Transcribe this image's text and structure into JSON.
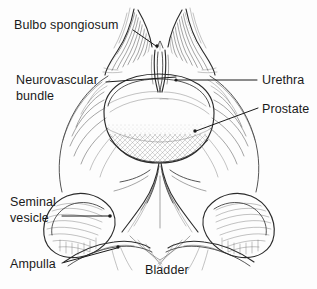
{
  "figure": {
    "style": "pen-and-ink line drawing",
    "background_color": "#fdfdfd",
    "ink_color": "#2b2b2b",
    "width": 317,
    "height": 289
  },
  "labels": [
    {
      "id": "bulbo-spongiosum",
      "text": "Bulbo spongiosum",
      "lines": [
        "Bulbo spongiosum"
      ],
      "text_x": 14,
      "text_y": 29,
      "anchor": "start",
      "leader": {
        "type": "line",
        "x1": 133,
        "y1": 30,
        "x2": 156,
        "y2": 46
      },
      "dot": {
        "x": 157,
        "y": 46
      }
    },
    {
      "id": "neurovascular-bundle",
      "text": "Neurovascular bundle",
      "lines": [
        "Neurovascular",
        "bundle"
      ],
      "text_x": 16,
      "text_y": 84,
      "anchor": "start",
      "leader": {
        "type": "line",
        "x1": 106,
        "y1": 82,
        "x2": 176,
        "y2": 77
      },
      "dot": null
    },
    {
      "id": "urethra",
      "text": "Urethra",
      "lines": [
        "Urethra"
      ],
      "text_x": 262,
      "text_y": 84,
      "anchor": "start",
      "leader": {
        "type": "line",
        "x1": 257,
        "y1": 80,
        "x2": 176,
        "y2": 80
      },
      "dot": {
        "x": 176,
        "y": 80
      }
    },
    {
      "id": "prostate",
      "text": "Prostate",
      "lines": [
        "Prostate"
      ],
      "text_x": 262,
      "text_y": 113,
      "anchor": "start",
      "leader": {
        "type": "line",
        "x1": 258,
        "y1": 108,
        "x2": 196,
        "y2": 131
      },
      "dot": {
        "x": 195,
        "y": 131
      }
    },
    {
      "id": "seminal-vesicle",
      "text": "Seminal vesicle",
      "lines": [
        "Seminal",
        "vesicle"
      ],
      "text_x": 10,
      "text_y": 206,
      "anchor": "start",
      "leader": {
        "type": "line",
        "x1": 62,
        "y1": 216,
        "x2": 109,
        "y2": 216
      },
      "dot": {
        "x": 110,
        "y": 216
      }
    },
    {
      "id": "ampulla",
      "text": "Ampulla",
      "lines": [
        "Ampulla"
      ],
      "text_x": 10,
      "text_y": 268,
      "anchor": "start",
      "leader": {
        "type": "line",
        "x1": 62,
        "y1": 263,
        "x2": 117,
        "y2": 248
      },
      "dot": {
        "x": 118,
        "y": 247
      }
    },
    {
      "id": "bladder",
      "text": "Bladder",
      "lines": [
        "Bladder"
      ],
      "text_x": 145,
      "text_y": 274,
      "anchor": "start",
      "leader": null,
      "dot": null
    }
  ]
}
